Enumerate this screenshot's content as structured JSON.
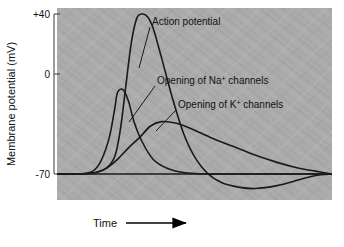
{
  "figure": {
    "caption_present": false,
    "background_color": "#ababab",
    "plot_area": {
      "x": 57,
      "y": 8,
      "width": 275,
      "height": 192
    },
    "curve_color": "#1a1a1a",
    "axis_color": "#3a3a3a"
  },
  "yaxis": {
    "title": "Membrane potential (mV)",
    "ticks": [
      {
        "label": "+40",
        "value": 40,
        "y": 14
      },
      {
        "label": "0",
        "value": 0,
        "y": 74
      },
      {
        "label": "-70",
        "value": -70,
        "y": 174
      }
    ],
    "range": [
      -85,
      45
    ]
  },
  "xaxis": {
    "title": "Time",
    "arrow_icon": "right-arrow-icon",
    "ticks": []
  },
  "annotations": [
    {
      "id": "action-potential",
      "text": "Action potential",
      "text_x": 152,
      "text_y": 22,
      "leader": {
        "x1": 150,
        "y1": 27,
        "x2": 139,
        "y2": 68
      }
    },
    {
      "id": "na-channels",
      "text_parts": {
        "pre": "Opening of Na",
        "sup": "+",
        "post": " channels"
      },
      "text": "Opening of Na+ channels",
      "text_x": 157,
      "text_y": 82,
      "leader": {
        "x1": 155,
        "y1": 86,
        "x2": 129,
        "y2": 122
      }
    },
    {
      "id": "k-channels",
      "text_parts": {
        "pre": "Opening of K",
        "sup": "+",
        "post": " channels"
      },
      "text": "Opening of K+ channels",
      "text_x": 178,
      "text_y": 106,
      "leader": {
        "x1": 176,
        "y1": 110,
        "x2": 156,
        "y2": 131
      }
    }
  ],
  "chart_data": {
    "type": "line",
    "title": "",
    "xlabel": "Time",
    "ylabel": "Membrane potential (mV)",
    "ylim": [
      -85,
      45
    ],
    "xlim": [
      0,
      100
    ],
    "grid": false,
    "legend": "inline-annotations",
    "y_tick_values": [
      40,
      0,
      -70
    ],
    "y_tick_labels": [
      "+40",
      "0",
      "-70"
    ],
    "series": [
      {
        "name": "Action potential",
        "units": "mV",
        "description": "Membrane potential spike rising from -70 mV to +40 mV, repolarizing and undershooting to about -80 mV before returning to rest.",
        "x": [
          0,
          8,
          14,
          18,
          21,
          23,
          25,
          27,
          29,
          31,
          33,
          35,
          38,
          42,
          46,
          50,
          55,
          60,
          66,
          72,
          80,
          88,
          94,
          100
        ],
        "y": [
          -70,
          -70,
          -69,
          -66,
          -58,
          -40,
          -10,
          20,
          37,
          40,
          38,
          30,
          10,
          -18,
          -42,
          -58,
          -70,
          -76,
          -79,
          -80,
          -78,
          -74,
          -71,
          -70
        ]
      },
      {
        "name": "Opening of Na+ channels",
        "units": "relative conductance (arbitrary, plotted on mV axis)",
        "description": "Sodium conductance rises sharply and peaks early, then falls rapidly back to baseline.",
        "x": [
          0,
          8,
          13,
          16,
          19,
          21,
          22,
          24,
          26,
          28,
          31,
          35,
          40,
          46,
          54,
          64,
          80,
          100
        ],
        "y": [
          -70,
          -70,
          -68,
          -61,
          -45,
          -25,
          -14,
          -12,
          -20,
          -34,
          -48,
          -60,
          -66,
          -69,
          -70,
          -70,
          -70,
          -70
        ]
      },
      {
        "name": "Opening of K+ channels",
        "units": "relative conductance (arbitrary, plotted on mV axis)",
        "description": "Potassium conductance rises later, peaks lower and broader, then decays slowly back toward baseline.",
        "x": [
          0,
          8,
          14,
          18,
          22,
          26,
          30,
          34,
          38,
          43,
          49,
          56,
          64,
          72,
          80,
          88,
          94,
          100
        ],
        "y": [
          -70,
          -70,
          -69,
          -66,
          -60,
          -52,
          -45,
          -37,
          -34,
          -35,
          -39,
          -45,
          -51,
          -57,
          -62,
          -66,
          -68,
          -70
        ]
      }
    ],
    "baseline": {
      "value": -70,
      "label": "resting potential",
      "drawn": true
    }
  }
}
